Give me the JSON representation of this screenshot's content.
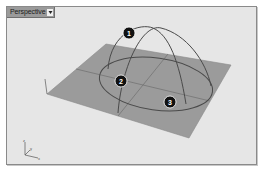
{
  "viewport": {
    "title": "Perspective",
    "dropdown_icon": "triangle-down",
    "background_color": "#e6e6e6",
    "plane_color": "#9b9b9b",
    "curve_color": "#4a4a4a"
  },
  "callouts": [
    {
      "number": "1",
      "label": "1"
    },
    {
      "number": "2",
      "label": "2"
    },
    {
      "number": "3",
      "label": "3"
    }
  ],
  "axis_gizmo": {
    "x_label": "x",
    "y_label": "y",
    "z_label": "z"
  }
}
